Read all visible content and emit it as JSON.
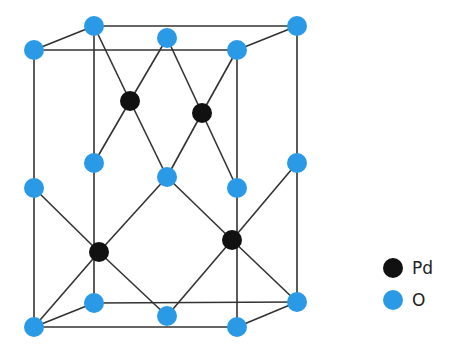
{
  "diagram": {
    "title": "",
    "colors": {
      "O": "#2a9ae6",
      "Pd": "#111111",
      "bond": "#333333"
    },
    "atoms": [
      {
        "id": "o1",
        "type": "O",
        "x": 34,
        "y": 50
      },
      {
        "id": "o2",
        "type": "O",
        "x": 94,
        "y": 26
      },
      {
        "id": "o3",
        "type": "O",
        "x": 167,
        "y": 38
      },
      {
        "id": "o4",
        "type": "O",
        "x": 237,
        "y": 50
      },
      {
        "id": "o5",
        "type": "O",
        "x": 297,
        "y": 26
      },
      {
        "id": "o6",
        "type": "O",
        "x": 34,
        "y": 188
      },
      {
        "id": "o7",
        "type": "O",
        "x": 94,
        "y": 163
      },
      {
        "id": "o8",
        "type": "O",
        "x": 167,
        "y": 177
      },
      {
        "id": "o9",
        "type": "O",
        "x": 237,
        "y": 188
      },
      {
        "id": "o10",
        "type": "O",
        "x": 297,
        "y": 163
      },
      {
        "id": "o11",
        "type": "O",
        "x": 34,
        "y": 327
      },
      {
        "id": "o12",
        "type": "O",
        "x": 94,
        "y": 303
      },
      {
        "id": "o13",
        "type": "O",
        "x": 167,
        "y": 316
      },
      {
        "id": "o14",
        "type": "O",
        "x": 237,
        "y": 327
      },
      {
        "id": "o15",
        "type": "O",
        "x": 297,
        "y": 302
      },
      {
        "id": "pd1",
        "type": "Pd",
        "x": 130,
        "y": 101
      },
      {
        "id": "pd2",
        "type": "Pd",
        "x": 202,
        "y": 113
      },
      {
        "id": "pd3",
        "type": "Pd",
        "x": 99,
        "y": 252
      },
      {
        "id": "pd4",
        "type": "Pd",
        "x": 232,
        "y": 240
      }
    ],
    "bonds": [
      [
        "o1",
        "o4"
      ],
      [
        "o2",
        "o5"
      ],
      [
        "o1",
        "o2"
      ],
      [
        "o4",
        "o5"
      ],
      [
        "o11",
        "o14"
      ],
      [
        "o12",
        "o15"
      ],
      [
        "o11",
        "o12"
      ],
      [
        "o14",
        "o15"
      ],
      [
        "o1",
        "o11"
      ],
      [
        "o2",
        "o12"
      ],
      [
        "o4",
        "o14"
      ],
      [
        "o5",
        "o15"
      ],
      [
        "pd1",
        "o2"
      ],
      [
        "pd1",
        "o3"
      ],
      [
        "pd1",
        "o7"
      ],
      [
        "pd1",
        "o8"
      ],
      [
        "pd2",
        "o3"
      ],
      [
        "pd2",
        "o4"
      ],
      [
        "pd2",
        "o8"
      ],
      [
        "pd2",
        "o9"
      ],
      [
        "pd3",
        "o6"
      ],
      [
        "pd3",
        "o8"
      ],
      [
        "pd3",
        "o11"
      ],
      [
        "pd3",
        "o13"
      ],
      [
        "pd4",
        "o8"
      ],
      [
        "pd4",
        "o10"
      ],
      [
        "pd4",
        "o13"
      ],
      [
        "pd4",
        "o15"
      ]
    ]
  },
  "legend": {
    "items": [
      {
        "label": "Pd",
        "color": "#111111",
        "x": 393,
        "y": 268
      },
      {
        "label": "O",
        "color": "#2a9ae6",
        "x": 393,
        "y": 300
      }
    ]
  }
}
